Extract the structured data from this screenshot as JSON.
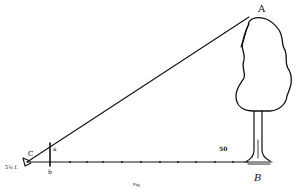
{
  "diagram": {
    "labels": {
      "top_of_tree": "A",
      "base_of_tree": "B",
      "eye_point": "C",
      "stick_top": "a",
      "stick_base": "b",
      "eye_height": "5½ f.",
      "distance_mark": "50",
      "caption": "Fig."
    },
    "points": {
      "C": [
        27,
        162
      ],
      "a": [
        50,
        148
      ],
      "b": [
        50,
        162
      ],
      "A": [
        249,
        17
      ],
      "B": [
        258,
        162
      ]
    },
    "colors": {
      "ink": "#111111",
      "background": "#ffffff"
    }
  }
}
